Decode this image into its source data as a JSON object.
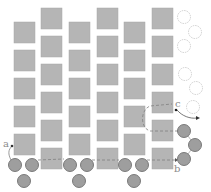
{
  "diagram": {
    "colors": {
      "square_fill": "#b5b5b5",
      "square_edge": "#a8a8a8",
      "circle_fill": "#9e9e9e",
      "circle_stroke": "#6f6f6f",
      "ghost_stroke": "#c8c8c8",
      "path_stroke": "#707070",
      "label": "#8a8a8a"
    },
    "square_size": 21,
    "squares": [
      {
        "x": 14,
        "y": 22
      },
      {
        "x": 14,
        "y": 50
      },
      {
        "x": 14,
        "y": 78
      },
      {
        "x": 14,
        "y": 106
      },
      {
        "x": 14,
        "y": 134
      },
      {
        "x": 41,
        "y": 8
      },
      {
        "x": 41,
        "y": 36
      },
      {
        "x": 41,
        "y": 64
      },
      {
        "x": 41,
        "y": 92
      },
      {
        "x": 41,
        "y": 120
      },
      {
        "x": 41,
        "y": 148
      },
      {
        "x": 69,
        "y": 22
      },
      {
        "x": 69,
        "y": 50
      },
      {
        "x": 69,
        "y": 78
      },
      {
        "x": 69,
        "y": 106
      },
      {
        "x": 69,
        "y": 134
      },
      {
        "x": 97,
        "y": 8
      },
      {
        "x": 97,
        "y": 36
      },
      {
        "x": 97,
        "y": 64
      },
      {
        "x": 97,
        "y": 92
      },
      {
        "x": 97,
        "y": 120
      },
      {
        "x": 97,
        "y": 148
      },
      {
        "x": 124,
        "y": 22
      },
      {
        "x": 124,
        "y": 50
      },
      {
        "x": 124,
        "y": 78
      },
      {
        "x": 124,
        "y": 106
      },
      {
        "x": 124,
        "y": 134
      },
      {
        "x": 152,
        "y": 8
      },
      {
        "x": 152,
        "y": 36
      },
      {
        "x": 152,
        "y": 64
      },
      {
        "x": 152,
        "y": 92
      },
      {
        "x": 152,
        "y": 120
      },
      {
        "x": 152,
        "y": 148
      }
    ],
    "circle_radius": 6.5,
    "circles": [
      {
        "cx": 15,
        "cy": 165
      },
      {
        "cx": 32,
        "cy": 165
      },
      {
        "cx": 24,
        "cy": 181
      },
      {
        "cx": 70,
        "cy": 165
      },
      {
        "cx": 87,
        "cy": 165
      },
      {
        "cx": 79,
        "cy": 181
      },
      {
        "cx": 125,
        "cy": 165
      },
      {
        "cx": 142,
        "cy": 165
      },
      {
        "cx": 134,
        "cy": 181
      },
      {
        "cx": 184,
        "cy": 131
      },
      {
        "cx": 195,
        "cy": 145
      },
      {
        "cx": 184,
        "cy": 159
      }
    ],
    "ghost_circles": [
      {
        "cx": 184,
        "cy": 17
      },
      {
        "cx": 195,
        "cy": 32
      },
      {
        "cx": 184,
        "cy": 46
      },
      {
        "cx": 185,
        "cy": 74
      },
      {
        "cx": 196,
        "cy": 88
      },
      {
        "cx": 193,
        "cy": 107
      }
    ],
    "labels": {
      "a": "a",
      "b": "b",
      "c": "c"
    }
  }
}
